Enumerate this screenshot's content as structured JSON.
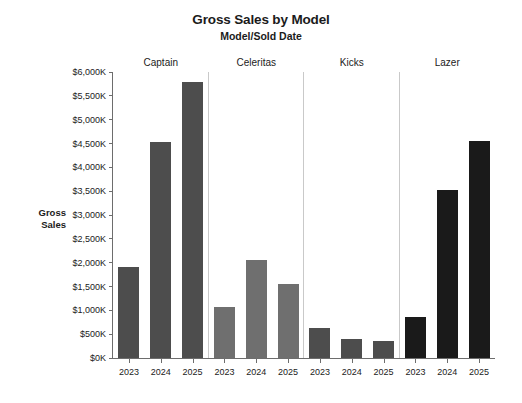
{
  "chart_data": {
    "type": "bar",
    "title": "Gross Sales by Model",
    "subtitle": "Model/Sold Date",
    "xlabel": "",
    "ylabel": "Gross Sales",
    "ylim": [
      0,
      6000
    ],
    "grid": false,
    "legend": "none",
    "facet_by": "Model",
    "categories": [
      "2023",
      "2024",
      "2025"
    ],
    "y_tick_labels": [
      "$6,000K",
      "$5,500K",
      "$5,000K",
      "$4,500K",
      "$4,000K",
      "$3,500K",
      "$3,000K",
      "$2,500K",
      "$2,000K",
      "$1,500K",
      "$1,000K",
      "$500K",
      "$0K"
    ],
    "y_tick_values": [
      6000,
      5500,
      5000,
      4500,
      4000,
      3500,
      3000,
      2500,
      2000,
      1500,
      1000,
      500,
      0
    ],
    "units": "thousands of dollars (K)",
    "panels": [
      {
        "name": "Captain",
        "color": "#4d4d4d",
        "bars": [
          {
            "x": "2023",
            "value": 1900
          },
          {
            "x": "2024",
            "value": 4530
          },
          {
            "x": "2025",
            "value": 5800
          }
        ]
      },
      {
        "name": "Celeritas",
        "color": "#6f6f6f",
        "bars": [
          {
            "x": "2023",
            "value": 1080
          },
          {
            "x": "2024",
            "value": 2050
          },
          {
            "x": "2025",
            "value": 1560
          }
        ]
      },
      {
        "name": "Kicks",
        "color": "#4d4d4d",
        "bars": [
          {
            "x": "2023",
            "value": 620
          },
          {
            "x": "2024",
            "value": 390
          },
          {
            "x": "2025",
            "value": 360
          }
        ]
      },
      {
        "name": "Lazer",
        "color": "#1a1a1a",
        "bars": [
          {
            "x": "2023",
            "value": 870
          },
          {
            "x": "2024",
            "value": 3520
          },
          {
            "x": "2025",
            "value": 4560
          }
        ]
      }
    ]
  },
  "axis": {
    "y_title_line1": "Gross",
    "y_title_line2": "Sales"
  },
  "colors": {
    "background": "#ffffff",
    "axis": "#6d6d6d",
    "divider": "#c9c9c9",
    "text": "#1b1b1b"
  }
}
